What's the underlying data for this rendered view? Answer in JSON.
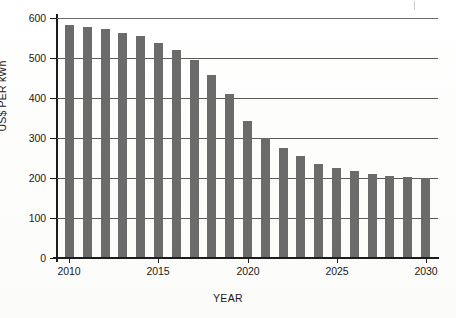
{
  "chart_data": {
    "type": "bar",
    "title": "",
    "subtitle": "",
    "xlabel": "YEAR",
    "ylabel": "US$ PER kWh",
    "xlim": [
      2009.3,
      2030.7
    ],
    "ylim": [
      0,
      600
    ],
    "grid": true,
    "legend": null,
    "legend_position": "none",
    "bar_color": "#6b6b6b",
    "axis_color": "#1c1c1c",
    "gridline_color": "#5c5c5c",
    "ytick_labels": [
      "600",
      "500",
      "400",
      "300",
      "200",
      "100",
      "0"
    ],
    "ytick_values": [
      600,
      500,
      400,
      300,
      200,
      100,
      0
    ],
    "xtick_labels": [
      "2010",
      "2015",
      "2020",
      "2025",
      "2030"
    ],
    "xtick_values": [
      2010,
      2015,
      2020,
      2025,
      2030
    ],
    "categories": [
      "2010",
      "2011",
      "2012",
      "2013",
      "2014",
      "2015",
      "2016",
      "2017",
      "2018",
      "2019",
      "2020",
      "2021",
      "2022",
      "2023",
      "2024",
      "2025",
      "2026",
      "2027",
      "2028",
      "2029",
      "2030"
    ],
    "values": [
      583,
      578,
      572,
      563,
      554,
      538,
      520,
      495,
      457,
      410,
      343,
      300,
      275,
      254,
      236,
      226,
      218,
      210,
      205,
      202,
      201
    ],
    "series": [
      {
        "name": "US$ PER kWh",
        "values": [
          583,
          578,
          572,
          563,
          554,
          538,
          520,
          495,
          457,
          410,
          343,
          300,
          275,
          254,
          236,
          226,
          218,
          210,
          205,
          202,
          201
        ]
      }
    ],
    "annotations": []
  }
}
